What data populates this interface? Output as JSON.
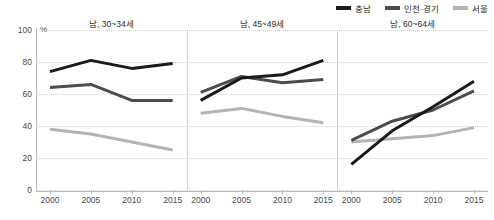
{
  "legend": {
    "position": "top-right",
    "items": [
      {
        "label": "충남",
        "color": "#1a1a1a",
        "icon": "line-swatch-icon"
      },
      {
        "label": "인천·경기",
        "color": "#4d4d4d",
        "icon": "line-swatch-icon"
      },
      {
        "label": "서울",
        "color": "#b3b3b3",
        "icon": "line-swatch-icon"
      }
    ]
  },
  "axis": {
    "unit": "%",
    "yticks": [
      "0",
      "20",
      "40",
      "60",
      "80",
      "100"
    ],
    "xticks": [
      "2000",
      "2005",
      "2010",
      "2015"
    ]
  },
  "panels": [
    {
      "title": "남, 30~34세"
    },
    {
      "title": "남, 45~49세"
    },
    {
      "title": "남, 60~64세"
    }
  ],
  "chart_data": {
    "type": "line",
    "title": "",
    "subtitle": "",
    "xlabel": "",
    "ylabel": "%",
    "ylim": [
      0,
      100
    ],
    "yticks": [
      0,
      20,
      40,
      60,
      80,
      100
    ],
    "grid": true,
    "legend_position": "top-right",
    "x": [
      2000,
      2005,
      2010,
      2015
    ],
    "panels": [
      {
        "title": "남, 30~34세",
        "series": [
          {
            "name": "충남",
            "color": "#1a1a1a",
            "values": [
              74,
              81,
              76,
              79
            ]
          },
          {
            "name": "인천·경기",
            "color": "#4d4d4d",
            "values": [
              64,
              66,
              56,
              56
            ]
          },
          {
            "name": "서울",
            "color": "#b3b3b3",
            "values": [
              38,
              35,
              30,
              25
            ]
          }
        ]
      },
      {
        "title": "남, 45~49세",
        "series": [
          {
            "name": "충남",
            "color": "#1a1a1a",
            "values": [
              56,
              70,
              72,
              81
            ]
          },
          {
            "name": "인천·경기",
            "color": "#4d4d4d",
            "values": [
              61,
              71,
              67,
              69
            ]
          },
          {
            "name": "서울",
            "color": "#b3b3b3",
            "values": [
              48,
              51,
              46,
              42
            ]
          }
        ]
      },
      {
        "title": "남, 60~64세",
        "series": [
          {
            "name": "충남",
            "color": "#1a1a1a",
            "values": [
              16,
              37,
              52,
              68
            ]
          },
          {
            "name": "인천·경기",
            "color": "#4d4d4d",
            "values": [
              31,
              43,
              50,
              62
            ]
          },
          {
            "name": "서울",
            "color": "#b3b3b3",
            "values": [
              30,
              32,
              34,
              39
            ]
          }
        ]
      }
    ]
  }
}
